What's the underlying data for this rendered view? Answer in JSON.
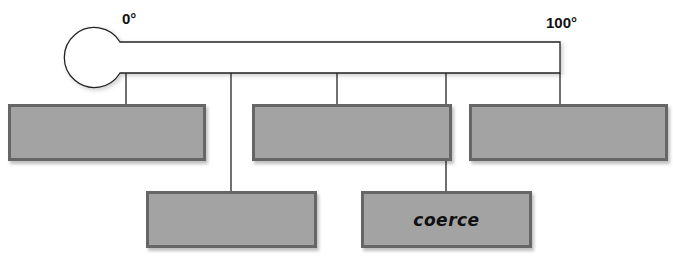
{
  "diagram": {
    "type": "thermometer-scale",
    "scale": {
      "min_label": "0°",
      "max_label": "100°"
    },
    "colors": {
      "box_fill": "#a3a3a3",
      "box_border": "#666666",
      "line": "#222222"
    },
    "boxes": [
      {
        "id": "box-1",
        "row": "top",
        "text": ""
      },
      {
        "id": "box-2",
        "row": "bottom",
        "text": ""
      },
      {
        "id": "box-3",
        "row": "top",
        "text": ""
      },
      {
        "id": "box-4",
        "row": "bottom",
        "text": "coerce"
      },
      {
        "id": "box-5",
        "row": "top",
        "text": ""
      }
    ]
  }
}
